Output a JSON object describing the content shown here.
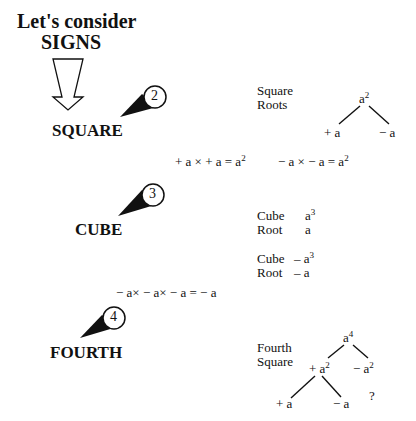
{
  "title": {
    "line1": "Let's consider",
    "line2": "SIGNS"
  },
  "sections": [
    {
      "badge": "2",
      "label": "SQUARE",
      "side_label_1": "Square",
      "side_label_2": "Roots",
      "tree": {
        "root": "a",
        "root_exp": "2",
        "left": "+ a",
        "right": "− a"
      },
      "equations": [
        {
          "lhs": "+ a × + a = a",
          "exp": "2"
        },
        {
          "lhs": "− a × − a = a",
          "exp": "2"
        }
      ]
    },
    {
      "badge": "3",
      "label": "CUBE",
      "rows": [
        {
          "name": "Cube",
          "value": "a",
          "exp": "3"
        },
        {
          "name": "Root",
          "value": "a",
          "exp": ""
        },
        {
          "name": "Cube",
          "value": "– a",
          "exp": "3"
        },
        {
          "name": "Root",
          "value": "– a",
          "exp": ""
        }
      ],
      "equation": "− a× − a× − a = − a"
    },
    {
      "badge": "4",
      "label": "FOURTH",
      "side_label_1": "Fourth",
      "side_label_2": "Square",
      "tree": {
        "root": "a",
        "root_exp": "4",
        "mid_left": "+ a",
        "mid_left_exp": "2",
        "mid_right": "− a",
        "mid_right_exp": "2",
        "leaf_left": "+ a",
        "leaf_right": "− a",
        "unknown": "?"
      }
    }
  ]
}
